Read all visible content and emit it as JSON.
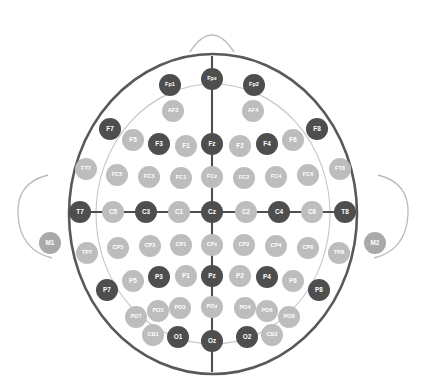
{
  "top_caption": "",
  "head": {
    "outline_color": "#595959",
    "inner_circle_color": "#c6c6c6",
    "axis_line_color": "#4e4e4e",
    "nose_shape": "nose-arc",
    "left_ear_shape": "ear-arc-left",
    "right_ear_shape": "ear-arc-right",
    "background": "#ffffff"
  },
  "legend": {
    "dark_color": "#4e4e4e",
    "light_color": "#bdbdbd",
    "mid_color": "#a9a9a9"
  },
  "chart_data": {
    "type": "scatter",
    "xlabel": "",
    "ylabel": "",
    "xlim": [
      0,
      427
    ],
    "ylim": [
      0,
      389
    ],
    "grid": false,
    "legend": "none",
    "rows": [
      "Fp",
      "AF",
      "F",
      "FC",
      "C",
      "CP",
      "P",
      "PO",
      "O",
      "Mastoid"
    ],
    "electrodes": [
      {
        "label": "Fp1",
        "x": 170,
        "y": 85,
        "r": 11,
        "shade": "dark",
        "row": "Fp"
      },
      {
        "label": "Fpz",
        "x": 212,
        "y": 79,
        "r": 11,
        "shade": "dark",
        "row": "Fp"
      },
      {
        "label": "Fp2",
        "x": 254,
        "y": 85,
        "r": 11,
        "shade": "dark",
        "row": "Fp"
      },
      {
        "label": "AF3",
        "x": 173,
        "y": 111,
        "r": 11,
        "shade": "light",
        "row": "AF"
      },
      {
        "label": "AF4",
        "x": 253,
        "y": 111,
        "r": 11,
        "shade": "light",
        "row": "AF"
      },
      {
        "label": "F7",
        "x": 110,
        "y": 129,
        "r": 11,
        "shade": "dark",
        "row": "F"
      },
      {
        "label": "F5",
        "x": 133,
        "y": 140,
        "r": 11,
        "shade": "light",
        "row": "F"
      },
      {
        "label": "F3",
        "x": 159,
        "y": 144,
        "r": 11,
        "shade": "dark",
        "row": "F"
      },
      {
        "label": "F1",
        "x": 186,
        "y": 146,
        "r": 11,
        "shade": "light",
        "row": "F"
      },
      {
        "label": "Fz",
        "x": 212,
        "y": 144,
        "r": 11,
        "shade": "dark",
        "row": "F"
      },
      {
        "label": "F2",
        "x": 240,
        "y": 146,
        "r": 11,
        "shade": "light",
        "row": "F"
      },
      {
        "label": "F4",
        "x": 267,
        "y": 144,
        "r": 11,
        "shade": "dark",
        "row": "F"
      },
      {
        "label": "F6",
        "x": 293,
        "y": 140,
        "r": 11,
        "shade": "light",
        "row": "F"
      },
      {
        "label": "F8",
        "x": 317,
        "y": 129,
        "r": 11,
        "shade": "dark",
        "row": "F"
      },
      {
        "label": "FT7",
        "x": 86,
        "y": 169,
        "r": 11,
        "shade": "light",
        "row": "FC"
      },
      {
        "label": "FC5",
        "x": 117,
        "y": 175,
        "r": 11,
        "shade": "light",
        "row": "FC"
      },
      {
        "label": "FC3",
        "x": 149,
        "y": 177,
        "r": 11,
        "shade": "light",
        "row": "FC"
      },
      {
        "label": "FC1",
        "x": 181,
        "y": 178,
        "r": 11,
        "shade": "light",
        "row": "FC"
      },
      {
        "label": "FCz",
        "x": 212,
        "y": 177,
        "r": 11,
        "shade": "light",
        "row": "FC"
      },
      {
        "label": "FC2",
        "x": 244,
        "y": 178,
        "r": 11,
        "shade": "light",
        "row": "FC"
      },
      {
        "label": "FC4",
        "x": 276,
        "y": 177,
        "r": 11,
        "shade": "light",
        "row": "FC"
      },
      {
        "label": "FC6",
        "x": 308,
        "y": 175,
        "r": 11,
        "shade": "light",
        "row": "FC"
      },
      {
        "label": "FT8",
        "x": 340,
        "y": 169,
        "r": 11,
        "shade": "light",
        "row": "FC"
      },
      {
        "label": "T7",
        "x": 80,
        "y": 212,
        "r": 11,
        "shade": "dark",
        "row": "C"
      },
      {
        "label": "C5",
        "x": 113,
        "y": 212,
        "r": 11,
        "shade": "light",
        "row": "C"
      },
      {
        "label": "C3",
        "x": 146,
        "y": 212,
        "r": 11,
        "shade": "dark",
        "row": "C"
      },
      {
        "label": "C1",
        "x": 179,
        "y": 212,
        "r": 11,
        "shade": "light",
        "row": "C"
      },
      {
        "label": "Cz",
        "x": 212,
        "y": 212,
        "r": 11,
        "shade": "dark",
        "row": "C"
      },
      {
        "label": "C2",
        "x": 246,
        "y": 212,
        "r": 11,
        "shade": "light",
        "row": "C"
      },
      {
        "label": "C4",
        "x": 279,
        "y": 212,
        "r": 11,
        "shade": "dark",
        "row": "C"
      },
      {
        "label": "C6",
        "x": 312,
        "y": 212,
        "r": 11,
        "shade": "light",
        "row": "C"
      },
      {
        "label": "T8",
        "x": 345,
        "y": 212,
        "r": 11,
        "shade": "dark",
        "row": "C"
      },
      {
        "label": "TP7",
        "x": 87,
        "y": 253,
        "r": 11,
        "shade": "light",
        "row": "CP"
      },
      {
        "label": "CP5",
        "x": 118,
        "y": 248,
        "r": 11,
        "shade": "light",
        "row": "CP"
      },
      {
        "label": "CP3",
        "x": 150,
        "y": 246,
        "r": 11,
        "shade": "light",
        "row": "CP"
      },
      {
        "label": "CP1",
        "x": 181,
        "y": 245,
        "r": 11,
        "shade": "light",
        "row": "CP"
      },
      {
        "label": "CPz",
        "x": 212,
        "y": 245,
        "r": 11,
        "shade": "light",
        "row": "CP"
      },
      {
        "label": "CP2",
        "x": 244,
        "y": 245,
        "r": 11,
        "shade": "light",
        "row": "CP"
      },
      {
        "label": "CP4",
        "x": 276,
        "y": 246,
        "r": 11,
        "shade": "light",
        "row": "CP"
      },
      {
        "label": "CP6",
        "x": 308,
        "y": 248,
        "r": 11,
        "shade": "light",
        "row": "CP"
      },
      {
        "label": "TP8",
        "x": 339,
        "y": 253,
        "r": 11,
        "shade": "light",
        "row": "CP"
      },
      {
        "label": "P7",
        "x": 107,
        "y": 290,
        "r": 11,
        "shade": "dark",
        "row": "P"
      },
      {
        "label": "P5",
        "x": 133,
        "y": 281,
        "r": 11,
        "shade": "light",
        "row": "P"
      },
      {
        "label": "P3",
        "x": 159,
        "y": 277,
        "r": 11,
        "shade": "dark",
        "row": "P"
      },
      {
        "label": "P1",
        "x": 186,
        "y": 276,
        "r": 11,
        "shade": "light",
        "row": "P"
      },
      {
        "label": "Pz",
        "x": 212,
        "y": 276,
        "r": 11,
        "shade": "dark",
        "row": "P"
      },
      {
        "label": "P2",
        "x": 240,
        "y": 276,
        "r": 11,
        "shade": "light",
        "row": "P"
      },
      {
        "label": "P4",
        "x": 267,
        "y": 277,
        "r": 11,
        "shade": "dark",
        "row": "P"
      },
      {
        "label": "P6",
        "x": 293,
        "y": 281,
        "r": 11,
        "shade": "light",
        "row": "P"
      },
      {
        "label": "P8",
        "x": 319,
        "y": 290,
        "r": 11,
        "shade": "dark",
        "row": "P"
      },
      {
        "label": "PO7",
        "x": 136,
        "y": 317,
        "r": 11,
        "shade": "light",
        "row": "PO"
      },
      {
        "label": "PO5",
        "x": 158,
        "y": 311,
        "r": 11,
        "shade": "light",
        "row": "PO"
      },
      {
        "label": "PO3",
        "x": 180,
        "y": 308,
        "r": 11,
        "shade": "light",
        "row": "PO"
      },
      {
        "label": "POz",
        "x": 212,
        "y": 307,
        "r": 11,
        "shade": "light",
        "row": "PO"
      },
      {
        "label": "PO4",
        "x": 245,
        "y": 308,
        "r": 11,
        "shade": "light",
        "row": "PO"
      },
      {
        "label": "PO6",
        "x": 267,
        "y": 311,
        "r": 11,
        "shade": "light",
        "row": "PO"
      },
      {
        "label": "PO8",
        "x": 289,
        "y": 317,
        "r": 11,
        "shade": "light",
        "row": "PO"
      },
      {
        "label": "CB1",
        "x": 153,
        "y": 335,
        "r": 11,
        "shade": "light",
        "row": "O"
      },
      {
        "label": "O1",
        "x": 178,
        "y": 337,
        "r": 11,
        "shade": "dark",
        "row": "O"
      },
      {
        "label": "Oz",
        "x": 212,
        "y": 341,
        "r": 11,
        "shade": "dark",
        "row": "O"
      },
      {
        "label": "O2",
        "x": 247,
        "y": 337,
        "r": 11,
        "shade": "dark",
        "row": "O"
      },
      {
        "label": "CB2",
        "x": 272,
        "y": 335,
        "r": 11,
        "shade": "light",
        "row": "O"
      },
      {
        "label": "M1",
        "x": 50,
        "y": 243,
        "r": 11,
        "shade": "mid",
        "row": "Mastoid"
      },
      {
        "label": "M2",
        "x": 375,
        "y": 243,
        "r": 11,
        "shade": "mid",
        "row": "Mastoid"
      }
    ]
  }
}
